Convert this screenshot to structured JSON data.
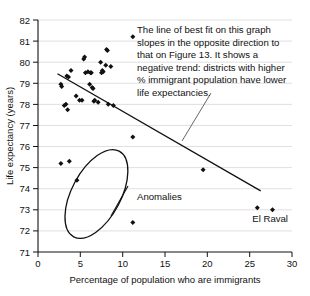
{
  "chart_data": {
    "type": "scatter",
    "title": "",
    "xlabel": "Percentage of population who are immigrants",
    "ylabel": "Life expectancy (years)",
    "xlim": [
      0,
      30
    ],
    "ylim": [
      71,
      82
    ],
    "xticks": [
      "0",
      "5",
      "10",
      "15",
      "20",
      "25",
      "30"
    ],
    "yticks": [
      "71",
      "72",
      "73",
      "74",
      "75",
      "76",
      "77",
      "78",
      "79",
      "80",
      "81",
      "82"
    ],
    "grid": "horizontal",
    "legend": "none",
    "marker": "diamond",
    "marker_color": "#111111",
    "points": [
      {
        "x": 2.7,
        "y": 78.95
      },
      {
        "x": 2.8,
        "y": 78.85
      },
      {
        "x": 3.1,
        "y": 77.95
      },
      {
        "x": 3.3,
        "y": 78.0
      },
      {
        "x": 3.4,
        "y": 79.35
      },
      {
        "x": 3.5,
        "y": 77.75
      },
      {
        "x": 3.6,
        "y": 79.3
      },
      {
        "x": 3.9,
        "y": 79.6
      },
      {
        "x": 4.5,
        "y": 78.4
      },
      {
        "x": 4.9,
        "y": 78.2
      },
      {
        "x": 5.2,
        "y": 78.2
      },
      {
        "x": 5.4,
        "y": 80.15
      },
      {
        "x": 5.5,
        "y": 80.25
      },
      {
        "x": 5.6,
        "y": 79.5
      },
      {
        "x": 5.9,
        "y": 79.55
      },
      {
        "x": 6.1,
        "y": 78.95
      },
      {
        "x": 6.2,
        "y": 79.5
      },
      {
        "x": 6.3,
        "y": 79.5
      },
      {
        "x": 6.4,
        "y": 78.8
      },
      {
        "x": 6.5,
        "y": 78.75
      },
      {
        "x": 6.6,
        "y": 78.15
      },
      {
        "x": 6.7,
        "y": 78.2
      },
      {
        "x": 7.1,
        "y": 78.1
      },
      {
        "x": 7.4,
        "y": 80.0
      },
      {
        "x": 7.5,
        "y": 79.5
      },
      {
        "x": 7.6,
        "y": 79.6
      },
      {
        "x": 7.7,
        "y": 79.55
      },
      {
        "x": 8.0,
        "y": 79.85
      },
      {
        "x": 8.1,
        "y": 80.6
      },
      {
        "x": 8.2,
        "y": 80.55
      },
      {
        "x": 8.3,
        "y": 78.0
      },
      {
        "x": 8.6,
        "y": 79.8
      },
      {
        "x": 8.9,
        "y": 77.95
      },
      {
        "x": 11.2,
        "y": 81.2
      },
      {
        "x": 11.2,
        "y": 76.45
      },
      {
        "x": 19.5,
        "y": 74.9
      },
      {
        "x": 25.9,
        "y": 73.1
      },
      {
        "x": 27.7,
        "y": 73.0
      },
      {
        "x": 2.7,
        "y": 75.2
      },
      {
        "x": 3.7,
        "y": 75.3
      },
      {
        "x": 4.6,
        "y": 74.4
      },
      {
        "x": 11.2,
        "y": 72.4
      }
    ],
    "trend_line": {
      "label": "line of best fit",
      "x1": 2.3,
      "y1": 79.45,
      "x2": 26.3,
      "y2": 73.9,
      "direction": "negative"
    }
  },
  "annotations": {
    "commentary": "The line of best fit on this graph slopes in the opposite direction to that on Figure 13. It shows a negative trend: districts with higher % immigrant population have lower life expectancies.",
    "commentary_lines": [
      "The line of best fit on this graph",
      "slopes in the opposite direction to",
      "that on Figure 13. It shows a",
      "negative trend: districts with higher",
      "% immigrant population have lower",
      "life expectancies."
    ],
    "anomalies_label": "Anomalies",
    "el_raval_label": "El Raval",
    "ellipse": {
      "label": "anomalies-ellipse",
      "center_x": 6.9,
      "center_y": 73.75,
      "rx": 2.9,
      "ry": 2.3,
      "rotation_deg": 28
    }
  }
}
